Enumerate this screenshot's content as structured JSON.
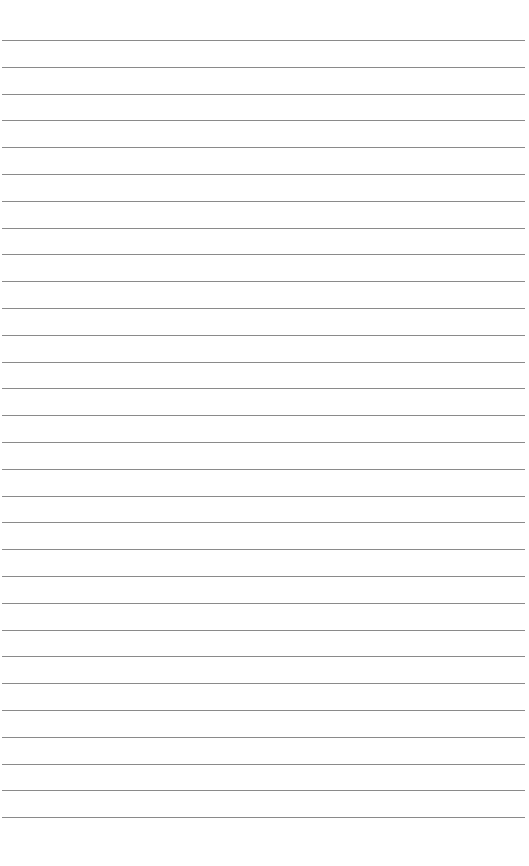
{
  "page": {
    "type": "lined-paper",
    "background": "#ffffff",
    "line_color": "#8a8a8a",
    "line_count": 30,
    "first_line_y": 40,
    "line_spacing": 26.8
  }
}
